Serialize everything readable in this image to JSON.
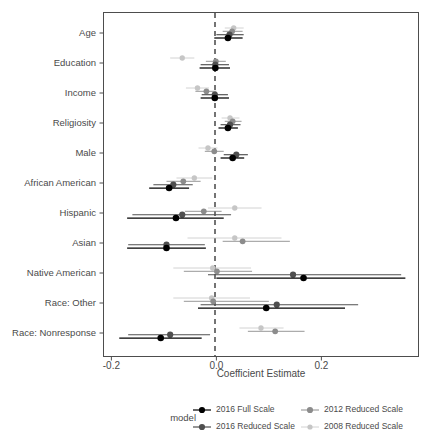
{
  "chart_data": {
    "type": "scatter",
    "plot_style": "coefficient-plot-with-error-bars",
    "title": "",
    "xlabel": "Coefficient Estimate",
    "ylabel": "",
    "xlim": [
      -0.215,
      0.385
    ],
    "xticks": [
      -0.2,
      0.0,
      0.2
    ],
    "xticklabels": [
      "-0.2",
      "0.0",
      "0.2"
    ],
    "grid": false,
    "reference_line": {
      "x": 0.0,
      "style": "dashed",
      "color": "#3a3a3a"
    },
    "legend": {
      "title": "model",
      "position": "bottom",
      "columns": 2,
      "entries": [
        {
          "name": "2016 Full Scale",
          "color": "#000000"
        },
        {
          "name": "2012 Reduced Scale",
          "color": "#8c8c8c"
        },
        {
          "name": "2016 Reduced Scale",
          "color": "#4f4f4f"
        },
        {
          "name": "2008 Reduced Scale",
          "color": "#c6c6c6"
        }
      ]
    },
    "categories": [
      "Age",
      "Education",
      "Income",
      "Religiosity",
      "Male",
      "African American",
      "Hispanic",
      "Asian",
      "Native American",
      "Race: Other",
      "Race: Nonresponse"
    ],
    "series": [
      {
        "name": "2016 Full Scale",
        "color": "#000000",
        "estimates": [
          0.022,
          -0.002,
          -0.003,
          0.022,
          0.031,
          -0.09,
          -0.077,
          -0.095,
          0.166,
          0.095,
          -0.106
        ],
        "ci_low": [
          -0.004,
          -0.032,
          -0.03,
          0.004,
          0.008,
          -0.128,
          -0.17,
          -0.17,
          0.0,
          -0.035,
          -0.185
        ],
        "ci_high": [
          0.05,
          0.026,
          0.024,
          0.041,
          0.053,
          -0.052,
          0.014,
          -0.02,
          0.36,
          0.245,
          -0.028
        ]
      },
      {
        "name": "2016 Reduced Scale",
        "color": "#4f4f4f",
        "estimates": [
          0.025,
          -0.002,
          -0.003,
          0.026,
          0.038,
          -0.082,
          -0.065,
          -0.095,
          0.146,
          0.115,
          -0.088
        ],
        "ci_low": [
          0.0,
          -0.03,
          -0.028,
          0.008,
          0.014,
          -0.12,
          -0.16,
          -0.168,
          -0.016,
          -0.03,
          -0.168
        ],
        "ci_high": [
          0.052,
          0.024,
          0.022,
          0.046,
          0.06,
          -0.045,
          0.028,
          -0.022,
          0.352,
          0.27,
          -0.012
        ]
      },
      {
        "name": "2012 Reduced Scale",
        "color": "#8c8c8c",
        "estimates": [
          0.03,
          -0.001,
          -0.019,
          0.031,
          -0.004,
          -0.063,
          -0.024,
          0.05,
          0.001,
          -0.006,
          0.112
        ],
        "ci_low": [
          0.012,
          -0.02,
          -0.04,
          0.016,
          -0.022,
          -0.095,
          -0.06,
          0.012,
          -0.062,
          -0.062,
          0.06
        ],
        "ci_high": [
          0.05,
          0.018,
          0.0,
          0.048,
          0.014,
          -0.03,
          0.01,
          0.14,
          0.068,
          0.1,
          0.168
        ]
      },
      {
        "name": "2008 Reduced Scale",
        "color": "#c6c6c6",
        "estimates": [
          0.033,
          -0.065,
          -0.036,
          0.026,
          -0.016,
          -0.042,
          0.035,
          0.035,
          -0.007,
          -0.009,
          0.085
        ],
        "ci_low": [
          0.016,
          -0.088,
          -0.058,
          0.01,
          -0.034,
          -0.076,
          -0.016,
          -0.055,
          -0.082,
          -0.082,
          0.044
        ],
        "ci_high": [
          0.052,
          -0.042,
          -0.014,
          0.044,
          0.002,
          -0.008,
          0.086,
          0.124,
          0.066,
          0.064,
          0.128
        ]
      }
    ]
  },
  "axis": {
    "x_title": "Coefficient Estimate",
    "tick_labels": [
      "-0.2",
      "0.0",
      "0.2"
    ],
    "category_labels": [
      "Age",
      "Education",
      "Income",
      "Religiosity",
      "Male",
      "African American",
      "Hispanic",
      "Asian",
      "Native American",
      "Race: Other",
      "Race: Nonresponse"
    ]
  },
  "legend": {
    "title": "model",
    "items": [
      "2016 Full Scale",
      "2012 Reduced Scale",
      "2016 Reduced Scale",
      "2008 Reduced Scale"
    ]
  }
}
